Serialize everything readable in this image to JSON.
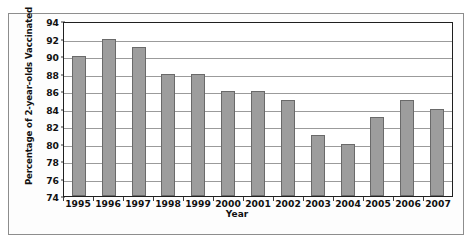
{
  "chart_data": {
    "type": "bar",
    "title": "",
    "xlabel": "Year",
    "ylabel": "Percentage of 2-year-olds Vaccinated",
    "categories": [
      "1995",
      "1996",
      "1997",
      "1998",
      "1999",
      "2000",
      "2001",
      "2002",
      "2003",
      "2004",
      "2005",
      "2006",
      "2007"
    ],
    "values": [
      90,
      92,
      91,
      88,
      88,
      86,
      86,
      85,
      81,
      80,
      83,
      85,
      84
    ],
    "ylim": [
      74,
      94
    ],
    "yticks": [
      74,
      76,
      78,
      80,
      82,
      84,
      86,
      88,
      90,
      92,
      94
    ],
    "ytick_labels": [
      "74",
      "76",
      "78",
      "80",
      "82",
      "84",
      "86",
      "88",
      "90",
      "92",
      "94"
    ],
    "grid": true,
    "legend": false,
    "legend_position": "none",
    "bar_color": "#9d9d9d",
    "bar_edge_color": "#6a6a6a",
    "axis_color": "#1f1f1f",
    "grid_color": "#9b9b9b",
    "frame_color": "#8d8d8d"
  }
}
